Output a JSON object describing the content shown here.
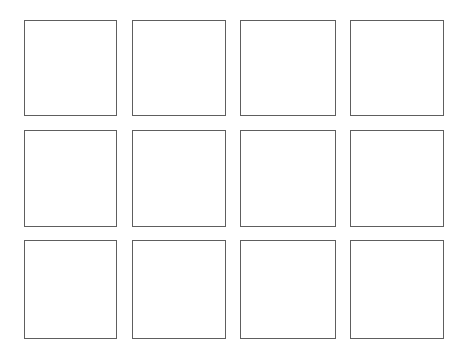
{
  "grid": {
    "rows": 3,
    "columns": 4,
    "border_color": "#5e5e5e",
    "background_color": "#ffffff",
    "column_x": [
      24,
      132,
      240,
      350
    ],
    "column_w": [
      93,
      94,
      96,
      94
    ],
    "row_y": [
      20,
      130,
      240
    ],
    "row_h": [
      96,
      97,
      99
    ],
    "cells": [
      {
        "row": 1,
        "col": 1,
        "content": ""
      },
      {
        "row": 1,
        "col": 2,
        "content": ""
      },
      {
        "row": 1,
        "col": 3,
        "content": ""
      },
      {
        "row": 1,
        "col": 4,
        "content": ""
      },
      {
        "row": 2,
        "col": 1,
        "content": ""
      },
      {
        "row": 2,
        "col": 2,
        "content": ""
      },
      {
        "row": 2,
        "col": 3,
        "content": ""
      },
      {
        "row": 2,
        "col": 4,
        "content": ""
      },
      {
        "row": 3,
        "col": 1,
        "content": ""
      },
      {
        "row": 3,
        "col": 2,
        "content": ""
      },
      {
        "row": 3,
        "col": 3,
        "content": ""
      },
      {
        "row": 3,
        "col": 4,
        "content": ""
      }
    ]
  }
}
